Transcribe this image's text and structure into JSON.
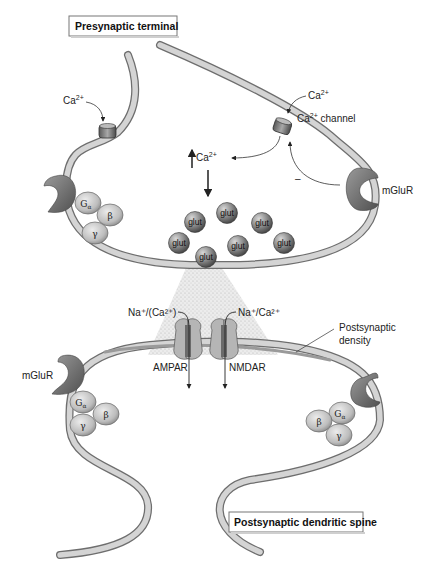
{
  "diagram": {
    "title_boxes": {
      "presynaptic": "Presynaptic terminal",
      "postsynaptic": "Postsynaptic dendritic spine"
    },
    "labels": {
      "ca_left": "Ca",
      "ca_left_sup": "2+",
      "ca_right": "Ca",
      "ca_right_sup": "2+",
      "ca_channel": "Ca",
      "ca_channel_sup": "2+",
      "ca_channel_suffix": " channel",
      "ca_rise": "Ca",
      "ca_rise_sup": "2+",
      "inhibition_sign": "–",
      "mglur_pre": "mGluR",
      "mglur_post": "mGluR",
      "ampar_ions": "Na⁺/(Ca²⁺)",
      "nmdar_ions": "Na⁺/Ca²⁺",
      "ampar": "AMPAR",
      "nmdar": "NMDAR",
      "psd_line1": "Postsynaptic",
      "psd_line2": "density"
    },
    "g_protein": {
      "alpha": "G",
      "alpha_sub": "α",
      "beta": "β",
      "gamma": "γ"
    },
    "vesicles": [
      "glut",
      "glut",
      "glut",
      "glut",
      "glut",
      "glut",
      "glut"
    ],
    "colors": {
      "membrane_fill": "#d2d2d2",
      "membrane_edge": "#6e6e6e",
      "receptor": "#707070",
      "vesicle": "#8a8a8a",
      "gprotein": "#c4c4c4",
      "cleft": "#dcdcdc"
    }
  }
}
